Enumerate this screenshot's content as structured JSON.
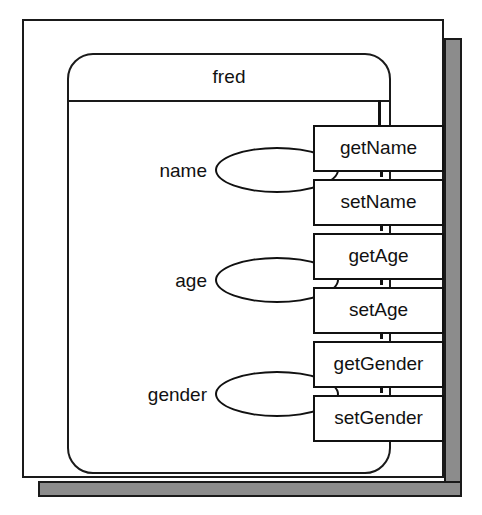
{
  "diagram": {
    "title": "fred",
    "object_name": "fred",
    "attributes": [
      {
        "label": "name",
        "value": ""
      },
      {
        "label": "age",
        "value": ""
      },
      {
        "label": "gender",
        "value": ""
      }
    ],
    "methods": [
      {
        "label": "getName"
      },
      {
        "label": "setName"
      },
      {
        "label": "getAge"
      },
      {
        "label": "setAge"
      },
      {
        "label": "getGender"
      },
      {
        "label": "setGender"
      }
    ],
    "colors": {
      "stroke": "#111111",
      "fill": "#ffffff",
      "shadow": "#8c8c8c",
      "background": "#ffffff"
    }
  }
}
